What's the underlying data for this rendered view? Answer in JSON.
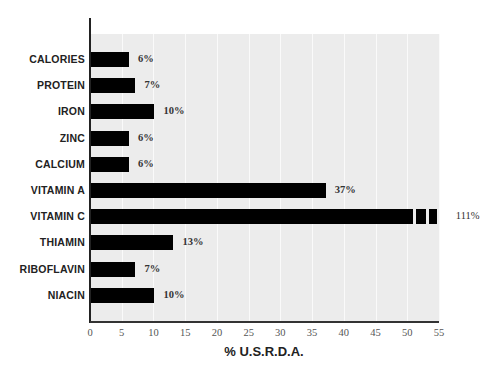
{
  "chart_data": {
    "type": "bar",
    "orientation": "horizontal",
    "title": "",
    "xlabel": "% U.S.R.D.A.",
    "ylabel": "",
    "xlim": [
      0,
      55
    ],
    "grid": true,
    "categories": [
      "CALORIES",
      "PROTEIN",
      "IRON",
      "ZINC",
      "CALCIUM",
      "VITAMIN A",
      "VITAMIN C",
      "THIAMIN",
      "RIBOFLAVIN",
      "NIACIN"
    ],
    "values": [
      6,
      7,
      10,
      6,
      6,
      37,
      111,
      13,
      7,
      10
    ],
    "value_labels": [
      "6%",
      "7%",
      "10%",
      "6%",
      "6%",
      "37%",
      "111%",
      "13%",
      "7%",
      "10%"
    ],
    "x_ticks": [
      "0",
      "5",
      "10",
      "15",
      "20",
      "25",
      "30",
      "35",
      "40",
      "45",
      "50",
      "55"
    ],
    "annotations": [
      "VITAMIN C bar truncated with break marks (value 111% exceeds axis max 55)"
    ],
    "bar_color": "#000000",
    "background_color": "#ececec"
  }
}
